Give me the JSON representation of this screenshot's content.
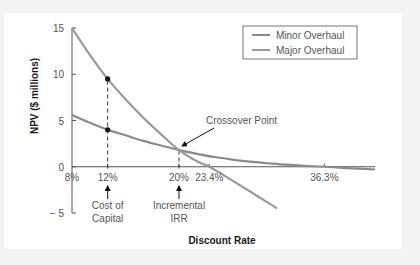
{
  "chart_data": {
    "type": "line",
    "title": "",
    "xlabel": "Discount Rate",
    "ylabel": "NPV ($ millions)",
    "xlim": [
      8,
      42
    ],
    "ylim": [
      -5,
      15
    ],
    "x_unit": "%",
    "grid": false,
    "legend_position": "top-right",
    "yticks": [
      15,
      10,
      5,
      0,
      -5
    ],
    "ytick_labels": [
      "15",
      "10",
      "5",
      "0",
      "− 5"
    ],
    "xticks": [
      8,
      12,
      20,
      23.4,
      36.3
    ],
    "xtick_labels": [
      "8%",
      "12%",
      "20%",
      "23.4%",
      "36.3%"
    ],
    "series": [
      {
        "name": "Minor Overhaul",
        "color": "#8a8a8a",
        "x": [
          8,
          10,
          12,
          14,
          16,
          18,
          20,
          22,
          24,
          26,
          28,
          30,
          32,
          34,
          36.3,
          38,
          40,
          42
        ],
        "y": [
          5.6,
          4.75,
          4.0,
          3.4,
          2.8,
          2.3,
          1.8,
          1.4,
          1.05,
          0.78,
          0.55,
          0.38,
          0.22,
          0.1,
          0.0,
          -0.1,
          -0.2,
          -0.3
        ]
      },
      {
        "name": "Major Overhaul",
        "color": "#999999",
        "x": [
          8,
          10,
          12,
          14,
          16,
          18,
          20,
          22,
          23.4,
          25,
          27,
          29,
          31
        ],
        "y": [
          15.0,
          12.1,
          9.5,
          7.3,
          5.3,
          3.5,
          1.8,
          0.6,
          0.0,
          -0.9,
          -2.1,
          -3.3,
          -4.5
        ]
      }
    ],
    "markers": [
      {
        "x": 12,
        "y": 9.5,
        "series": "Major Overhaul"
      },
      {
        "x": 12,
        "y": 4.0,
        "series": "Minor Overhaul"
      }
    ],
    "reference_lines": [
      {
        "x": 12,
        "style": "dashed",
        "from_y": -0.2,
        "to_y": 9.5
      },
      {
        "x": 20,
        "style": "dashed",
        "from_y": -0.2,
        "to_y": 1.8
      }
    ],
    "annotations": [
      {
        "text": "Crossover Point",
        "points_to": {
          "x": 20,
          "y": 1.8
        }
      },
      {
        "lines": [
          "Cost of",
          "Capital"
        ],
        "points_to": {
          "x": 12,
          "y": 0
        }
      },
      {
        "lines": [
          "Incremental",
          "IRR"
        ],
        "points_to": {
          "x": 20,
          "y": 0
        }
      }
    ]
  }
}
